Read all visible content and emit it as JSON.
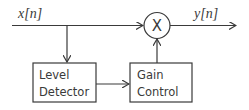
{
  "diagram": {
    "type": "block-diagram",
    "input_signal": "x[n]",
    "output_signal": "y[n]",
    "multiplier_symbol": "X",
    "blocks": [
      {
        "id": "level-detector",
        "lines": [
          "Level",
          "Detector"
        ]
      },
      {
        "id": "gain-control",
        "lines": [
          "Gain",
          "Control"
        ]
      }
    ],
    "connections": [
      {
        "from": "x[n]",
        "to": "multiplier"
      },
      {
        "from": "x[n]",
        "to": "level-detector"
      },
      {
        "from": "level-detector",
        "to": "gain-control"
      },
      {
        "from": "gain-control",
        "to": "multiplier"
      },
      {
        "from": "multiplier",
        "to": "y[n]"
      }
    ],
    "colors": {
      "stroke": "#3a3a3a",
      "background": "#ffffff"
    }
  }
}
